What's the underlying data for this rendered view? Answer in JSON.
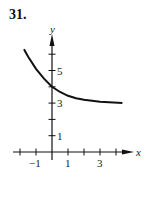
{
  "problem_number": "31.",
  "chart_data": {
    "type": "line",
    "title": "",
    "xlabel": "x",
    "ylabel": "y",
    "xlim": [
      -2.3,
      5
    ],
    "ylim": [
      0,
      6.9
    ],
    "x_ticks": [
      -2,
      -1,
      0,
      1,
      2,
      3,
      4
    ],
    "x_tick_labels": [
      "-1",
      "1",
      "3"
    ],
    "y_ticks": [
      1,
      2,
      3,
      4,
      5,
      6
    ],
    "y_tick_labels": [
      "1",
      "3",
      "5"
    ],
    "grid": false,
    "series": [
      {
        "name": "curve",
        "x": [
          -1.75,
          -1.5,
          -1,
          -0.5,
          0,
          0.5,
          1,
          1.5,
          2,
          3,
          4.4
        ],
        "y": [
          6.3,
          5.85,
          5.1,
          4.5,
          4.0,
          3.68,
          3.45,
          3.3,
          3.2,
          3.08,
          3.0
        ]
      }
    ],
    "annotations": [
      "Curve decreasing toward horizontal asymptote near y=3, y-intercept at 4"
    ]
  }
}
